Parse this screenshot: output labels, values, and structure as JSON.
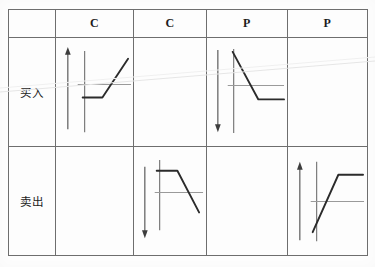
{
  "document": {
    "type": "scanned-table",
    "language": "zh-CN",
    "description": "Option payoff diagram matrix: buy/sell rows by Call/Call/Put/Put columns"
  },
  "table": {
    "corner_label": "",
    "column_headers": [
      {
        "id": "call-buy",
        "label": "C"
      },
      {
        "id": "call-sell",
        "label": "C"
      },
      {
        "id": "put-buy",
        "label": "P"
      },
      {
        "id": "put-sell",
        "label": "P"
      }
    ],
    "row_headers": [
      {
        "id": "buy",
        "label": "买入"
      },
      {
        "id": "sell",
        "label": "卖出"
      }
    ],
    "cells": [
      {
        "row": "buy",
        "col": "call-buy",
        "has_diagram": true,
        "arrow": "up",
        "payoff": "long-call",
        "name": "long-call-payoff-diagram"
      },
      {
        "row": "buy",
        "col": "call-sell",
        "has_diagram": false,
        "name": "empty-cell"
      },
      {
        "row": "buy",
        "col": "put-buy",
        "has_diagram": true,
        "arrow": "down",
        "payoff": "long-put",
        "name": "long-put-payoff-diagram"
      },
      {
        "row": "buy",
        "col": "put-sell",
        "has_diagram": false,
        "name": "empty-cell"
      },
      {
        "row": "sell",
        "col": "call-buy",
        "has_diagram": false,
        "name": "empty-cell"
      },
      {
        "row": "sell",
        "col": "call-sell",
        "has_diagram": true,
        "arrow": "down",
        "payoff": "short-call",
        "name": "short-call-payoff-diagram"
      },
      {
        "row": "sell",
        "col": "put-buy",
        "has_diagram": false,
        "name": "empty-cell"
      },
      {
        "row": "sell",
        "col": "put-sell",
        "has_diagram": true,
        "arrow": "up",
        "payoff": "short-put",
        "name": "short-put-payoff-diagram"
      }
    ]
  },
  "colors": {
    "border": "#6e6e6e",
    "payoff_line": "#2b2b2b",
    "axis_line": "#8c8c8c",
    "arrow": "#4a4a4a",
    "text": "#1c1c1c",
    "paper": "#fdfdfd",
    "streak": "#e4e4e4"
  }
}
